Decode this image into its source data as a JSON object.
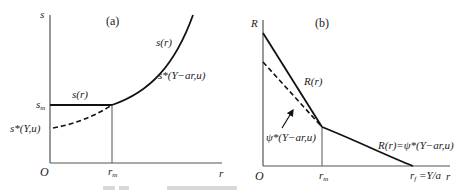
{
  "panel_a": {
    "label": "(a)",
    "y_axis": "s",
    "x_axis": "r",
    "origin": "O",
    "sm_label": "s",
    "sm_sub": "m",
    "rm_label": "r",
    "rm_sub": "m",
    "flat_label": "s(r)",
    "curve_label_top": "s(r)",
    "curve_label_bottom": "s*(Y−ar,u)",
    "dashed_label": "s*(Y,u)"
  },
  "panel_b": {
    "label": "(b)",
    "y_axis": "R",
    "x_axis": "r",
    "origin": "O",
    "rm_label": "r",
    "rm_sub": "m",
    "rf_label": "r",
    "rf_sub": "f",
    "rf_value": " =Y/a",
    "steep_label": "R(r)",
    "dashed_label": "ψ*(Y−ar,u)",
    "curve_label": "R(r)=ψ*(Y−ar,u)"
  }
}
